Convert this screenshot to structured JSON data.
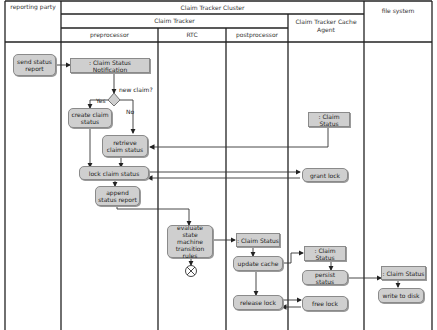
{
  "diagram": {
    "type": "UML activity diagram with swimlanes",
    "lanes": {
      "reporting_party": "reporting party",
      "cluster": "Claim Tracker Cluster",
      "claim_tracker": "Claim Tracker",
      "preprocessor": "preprocessor",
      "rtc": "RTC",
      "postprocessor": "postprocessor",
      "cache_agent": "Claim Tracker Cache Agent",
      "file_system": "file system"
    },
    "nodes": {
      "send_status_report": "send status report",
      "claim_status_notification": ": Claim Status  Notification",
      "decision_label": "new claim?",
      "yes_label": "Yes",
      "no_label": "No",
      "create_claim_status": "create claim status",
      "retrieve_claim_status": "retrieve claim status",
      "lock_claim_status": "lock claim status",
      "append_status_report": "append  status report",
      "evaluate_state_machine": "evaluate state machine transition rules",
      "claim_status_post": ": Claim Status",
      "update_cache": "update cache",
      "release_lock": "release lock",
      "claim_status_agent_top": ": Claim Status",
      "grant_lock": "grant lock",
      "claim_status_agent": ": Claim Status",
      "persist_status": "persist status",
      "free_lock": "free lock",
      "claim_status_fs": ": Claim Status",
      "write_to_disk": "write to disk"
    },
    "colors": {
      "node_fill": "#cfcfcf",
      "node_border": "#8a8a8a",
      "line": "#222222"
    }
  }
}
